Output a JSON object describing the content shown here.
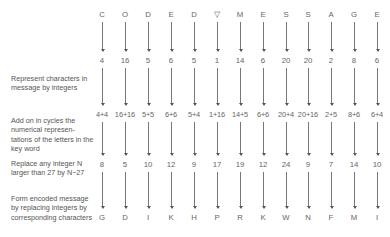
{
  "labels": {
    "represent": "Represent characters in message by integers",
    "add": "Add on in cycles the numerical represen-tations of the letters in the key word",
    "replace": "Replace any integer N larger than 27 by N−27",
    "form": "Form encoded message by replacing integers by corresponding characters"
  },
  "columns": [
    {
      "char": "C",
      "num": "4",
      "sum": "4+4",
      "replaced": "8",
      "encoded": "G"
    },
    {
      "char": "O",
      "num": "16",
      "sum": "16+16",
      "replaced": "5",
      "encoded": "D"
    },
    {
      "char": "D",
      "num": "5",
      "sum": "5+5",
      "replaced": "10",
      "encoded": "I"
    },
    {
      "char": "E",
      "num": "6",
      "sum": "6+6",
      "replaced": "12",
      "encoded": "K"
    },
    {
      "char": "D",
      "num": "5",
      "sum": "5+4",
      "replaced": "9",
      "encoded": "H"
    },
    {
      "char": "▽",
      "num": "1",
      "sum": "1+16",
      "replaced": "17",
      "encoded": "P"
    },
    {
      "char": "M",
      "num": "14",
      "sum": "14+5",
      "replaced": "19",
      "encoded": "R"
    },
    {
      "char": "E",
      "num": "6",
      "sum": "6+6",
      "replaced": "12",
      "encoded": "K"
    },
    {
      "char": "S",
      "num": "20",
      "sum": "20+4",
      "replaced": "24",
      "encoded": "W"
    },
    {
      "char": "S",
      "num": "20",
      "sum": "20+16",
      "replaced": "9",
      "encoded": "N"
    },
    {
      "char": "A",
      "num": "2",
      "sum": "2+5",
      "replaced": "7",
      "encoded": "F"
    },
    {
      "char": "G",
      "num": "8",
      "sum": "8+6",
      "replaced": "14",
      "encoded": "M"
    },
    {
      "char": "E",
      "num": "6",
      "sum": "6+4",
      "replaced": "10",
      "encoded": "I"
    }
  ]
}
